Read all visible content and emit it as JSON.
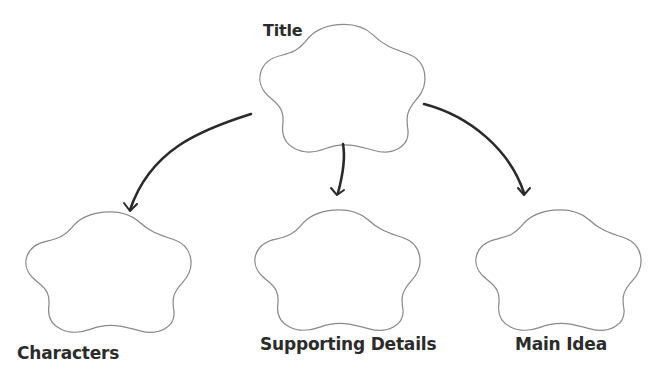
{
  "diagram": {
    "type": "graphic-organizer",
    "colors": {
      "outline": "#8a8a8a",
      "arrow": "#2a2a2a",
      "text": "#2b2b2b",
      "background": "#ffffff"
    },
    "nodes": [
      {
        "id": "title",
        "label": "Title",
        "shape": "cloud"
      },
      {
        "id": "characters",
        "label": "Characters",
        "shape": "cloud"
      },
      {
        "id": "supporting-details",
        "label": "Supporting Details",
        "shape": "cloud"
      },
      {
        "id": "main-idea",
        "label": "Main Idea",
        "shape": "cloud"
      }
    ],
    "edges": [
      {
        "from": "title",
        "to": "characters"
      },
      {
        "from": "title",
        "to": "supporting-details"
      },
      {
        "from": "title",
        "to": "main-idea"
      }
    ]
  }
}
